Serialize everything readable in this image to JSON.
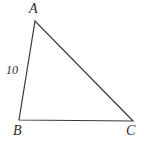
{
  "figure": {
    "type": "triangle-diagram",
    "width": 147,
    "height": 142,
    "background_color": "#ffffff",
    "stroke_color": "#3a3a3a",
    "stroke_width": 1.2,
    "text_color": "#2b2b2b"
  },
  "vertices": {
    "A": {
      "label": "A",
      "x": 35,
      "y": 21
    },
    "B": {
      "label": "B",
      "x": 19,
      "y": 120
    },
    "C": {
      "label": "C",
      "x": 133,
      "y": 121
    }
  },
  "sides": [
    {
      "name": "AB",
      "from": "A",
      "to": "B",
      "label": "10"
    },
    {
      "name": "BC",
      "from": "B",
      "to": "C",
      "label": ""
    },
    {
      "name": "AC",
      "from": "A",
      "to": "C",
      "label": ""
    }
  ],
  "labels": {
    "vertex_a": "A",
    "vertex_b": "B",
    "vertex_c": "C",
    "side_ab": "10"
  }
}
